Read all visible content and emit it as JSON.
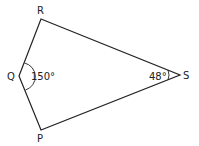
{
  "diagram": {
    "type": "quadrilateral (kite)",
    "vertices": {
      "R": {
        "label": "R",
        "x": 41,
        "y": 19
      },
      "Q": {
        "label": "Q",
        "x": 19,
        "y": 76
      },
      "P": {
        "label": "P",
        "x": 41,
        "y": 130
      },
      "S": {
        "label": "S",
        "x": 180,
        "y": 75
      }
    },
    "angles": {
      "Q": {
        "label": "150°",
        "value": 150
      },
      "S": {
        "label": "48°",
        "value": 48
      }
    },
    "colors": {
      "stroke": "#222222",
      "background": "#ffffff"
    }
  }
}
